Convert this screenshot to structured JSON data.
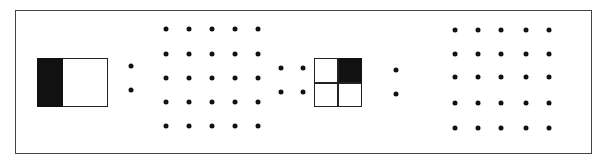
{
  "diagram": {
    "colors": {
      "ink": "#111111",
      "frame": "#444444",
      "background": "#ffffff"
    },
    "elements": [
      {
        "id": "bar-halves",
        "type": "split-rectangle",
        "parts": 2,
        "shaded": [
          0
        ]
      },
      {
        "id": "dots-pair-1",
        "type": "dot-column",
        "count": 2
      },
      {
        "id": "grid-5x5-1",
        "type": "dot-grid",
        "rows": 5,
        "cols": 5
      },
      {
        "id": "grid-2x2-dots",
        "type": "dot-grid",
        "rows": 2,
        "cols": 2
      },
      {
        "id": "square-quarters",
        "type": "split-square",
        "rows": 2,
        "cols": 2,
        "shaded": [
          [
            0,
            1
          ]
        ]
      },
      {
        "id": "dots-pair-2",
        "type": "dot-column",
        "count": 2
      },
      {
        "id": "grid-5x5-2",
        "type": "dot-grid",
        "rows": 5,
        "cols": 5
      }
    ]
  }
}
